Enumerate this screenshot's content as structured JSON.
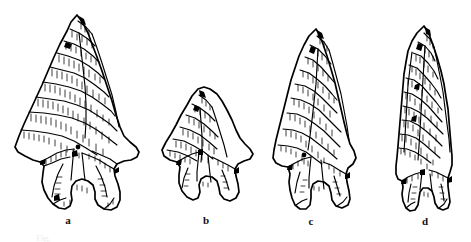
{
  "figure": {
    "type": "archaeological-illustration",
    "style": "pen-and-ink line drawing with flake-scar hatching",
    "background_color": "#ffffff",
    "ink_color": "#000000",
    "caption_text": "Fig.",
    "caption_visible": "partially cropped, illegible"
  },
  "specimens": [
    {
      "label": "a",
      "description": "large corner-notched point with barbs and bulbous expanding stem",
      "bbox": {
        "x": 13,
        "y": 14,
        "width": 127,
        "height": 202
      }
    },
    {
      "label": "b",
      "description": "small corner-notched point with short expanding stem",
      "bbox": {
        "x": 160,
        "y": 88,
        "width": 93,
        "height": 117
      }
    },
    {
      "label": "c",
      "description": "elongated triangular point with short contracting stem",
      "bbox": {
        "x": 272,
        "y": 28,
        "width": 83,
        "height": 182
      }
    },
    {
      "label": "d",
      "description": "narrow lanceolate point with slightly flared base",
      "bbox": {
        "x": 395,
        "y": 25,
        "width": 57,
        "height": 187
      }
    }
  ],
  "labels": {
    "a": "a",
    "b": "b",
    "c": "c",
    "d": "d"
  }
}
